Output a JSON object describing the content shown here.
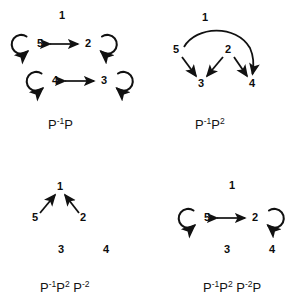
{
  "figure": {
    "background_color": "#ffffff",
    "ink_color": "#111111",
    "panels": [
      {
        "id": "top-left",
        "caption_parts": {
          "base1": "P",
          "sup1": "-1",
          "base2": "P"
        },
        "caption_text": "P-1P",
        "nodes": [
          {
            "label": "1",
            "x": 62,
            "y": 16
          },
          {
            "label": "5",
            "x": 40,
            "y": 44
          },
          {
            "label": "2",
            "x": 88,
            "y": 44
          },
          {
            "label": "4",
            "x": 55,
            "y": 81
          },
          {
            "label": "3",
            "x": 104,
            "y": 81
          }
        ],
        "edges": [
          {
            "from": "5",
            "to": "2",
            "kind": "double-arrow"
          },
          {
            "from": "4",
            "to": "3",
            "kind": "double-arrow"
          },
          {
            "from": "5",
            "to": "5",
            "kind": "self-loop-left"
          },
          {
            "from": "2",
            "to": "2",
            "kind": "self-loop-right"
          },
          {
            "from": "4",
            "to": "4",
            "kind": "self-loop-left"
          },
          {
            "from": "3",
            "to": "3",
            "kind": "self-loop-right"
          }
        ]
      },
      {
        "id": "top-right",
        "caption_parts": {
          "base1": "P",
          "sup1": "-1",
          "base2": "P",
          "sup2": "2"
        },
        "caption_text": "P-1P2",
        "nodes": [
          {
            "label": "1",
            "x": 54,
            "y": 18
          },
          {
            "label": "5",
            "x": 25,
            "y": 50
          },
          {
            "label": "2",
            "x": 77,
            "y": 50
          },
          {
            "label": "3",
            "x": 50,
            "y": 84
          },
          {
            "label": "4",
            "x": 101,
            "y": 84
          }
        ],
        "edges": [
          {
            "from": "5",
            "to": "4",
            "kind": "curved-arc"
          },
          {
            "from": "5",
            "to": "3",
            "kind": "straight-arrow"
          },
          {
            "from": "2",
            "to": "3",
            "kind": "straight-arrow"
          },
          {
            "from": "2",
            "to": "4",
            "kind": "straight-arrow"
          }
        ]
      },
      {
        "id": "bottom-left",
        "caption_parts": {
          "base1": "P",
          "sup1": "-1",
          "base2": "P",
          "sup2": "2",
          "base3": "P",
          "sup3": "-2"
        },
        "caption_text": "P-1P2 P-2",
        "nodes": [
          {
            "label": "1",
            "x": 60,
            "y": 34
          },
          {
            "label": "5",
            "x": 35,
            "y": 65
          },
          {
            "label": "2",
            "x": 83,
            "y": 65
          },
          {
            "label": "3",
            "x": 61,
            "y": 97
          },
          {
            "label": "4",
            "x": 106,
            "y": 97
          }
        ],
        "edges": [
          {
            "from": "5",
            "to": "1",
            "kind": "straight-arrow"
          },
          {
            "from": "2",
            "to": "1",
            "kind": "straight-arrow"
          }
        ]
      },
      {
        "id": "bottom-right",
        "caption_parts": {
          "base1": "P",
          "sup1": "-1",
          "base2": "P",
          "sup2": "2",
          "base3": "P",
          "sup3": "-2",
          "base4": "P"
        },
        "caption_text": "P-1P2 P-2P",
        "nodes": [
          {
            "label": "1",
            "x": 81,
            "y": 33
          },
          {
            "label": "5",
            "x": 56,
            "y": 65
          },
          {
            "label": "2",
            "x": 104,
            "y": 65
          },
          {
            "label": "3",
            "x": 76,
            "y": 97
          },
          {
            "label": "4",
            "x": 121,
            "y": 97
          }
        ],
        "edges": [
          {
            "from": "5",
            "to": "2",
            "kind": "double-arrow"
          },
          {
            "from": "5",
            "to": "5",
            "kind": "self-loop-left"
          },
          {
            "from": "2",
            "to": "2",
            "kind": "self-loop-right"
          }
        ]
      }
    ]
  }
}
